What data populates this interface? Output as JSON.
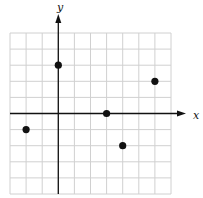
{
  "chart_data": {
    "type": "scatter",
    "title": "",
    "xlabel": "x",
    "ylabel": "y",
    "xlim": [
      -3,
      7
    ],
    "ylim": [
      -5,
      5
    ],
    "grid": true,
    "grid_step": 1,
    "legend": null,
    "points": [
      {
        "x": 0,
        "y": 3
      },
      {
        "x": 3,
        "y": 0
      },
      {
        "x": 6,
        "y": 2
      },
      {
        "x": -2,
        "y": -1
      },
      {
        "x": 4,
        "y": -2
      }
    ]
  },
  "colors": {
    "grid": "#d0d0d0",
    "axis": "#111111",
    "point": "#111111",
    "background": "#ffffff"
  },
  "layout": {
    "grid_left": 10,
    "grid_top": 33,
    "cell": 16.1,
    "axis_x_end": 186,
    "axis_y_end": 14,
    "x_label_pos": [
      193,
      119
    ],
    "y_label_pos": [
      57,
      11
    ]
  }
}
